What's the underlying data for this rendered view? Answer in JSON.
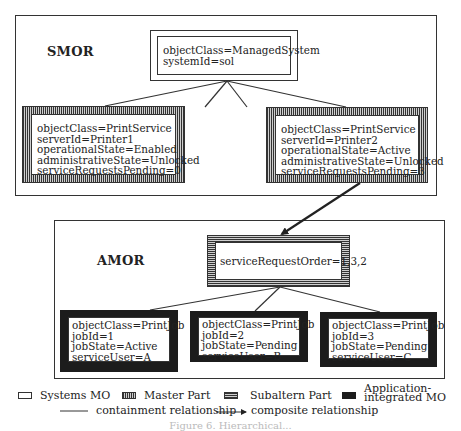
{
  "smor": {
    "label": "SMOR",
    "root": {
      "type": "systems",
      "lines": [
        "objectClass=ManagedSystem",
        "systemId=sol"
      ]
    },
    "children": [
      {
        "type": "master",
        "lines": [
          "objectClass=PrintService",
          "serverId=Printer1",
          "operationalState=Enabled",
          "administrativeState=Unlocked",
          "serviceRequestsPending=0"
        ]
      },
      {
        "type": "master",
        "lines": [
          "objectClass=PrintService",
          "serverId=Printer2",
          "operationalState=Active",
          "administrativeState=Unlocked",
          "serviceRequestsPending=3"
        ]
      }
    ]
  },
  "amor": {
    "label": "AMOR",
    "root": {
      "type": "subaltern",
      "lines": [
        "serviceRequestOrder=1,3,2"
      ]
    },
    "children": [
      {
        "type": "application-integrated",
        "lines": [
          "objectClass=PrintJob",
          "jobId=1",
          "jobState=Active",
          "serviceUser=A"
        ]
      },
      {
        "type": "application-integrated",
        "lines": [
          "objectClass=PrintJob",
          "jobId=2",
          "jobState=Pending",
          "serviceUser=B"
        ]
      },
      {
        "type": "application-integrated",
        "lines": [
          "objectClass=PrintJob",
          "jobId=3",
          "jobState=Pending",
          "serviceUser=C"
        ]
      }
    ]
  },
  "legend": {
    "systems_mo": "Systems MO",
    "master_part": "Master Part",
    "subaltern_part": "Subaltern Part",
    "app_integrated_line1": "Application-",
    "app_integrated_line2": "integrated MO",
    "containment": "containment relationship",
    "composite": "composite relationship"
  },
  "colors": {
    "line": "#333333",
    "app_integrated_fill": "#1c1c1c",
    "hatch_light": "#cfcfcf"
  },
  "caption": "Figure 6. Hierarchical..."
}
